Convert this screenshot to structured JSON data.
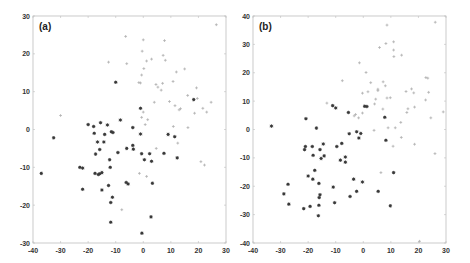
{
  "chart_data": [
    {
      "type": "scatter",
      "title": "(a)",
      "panel_label": "(a)",
      "xlabel": "",
      "ylabel": "",
      "xlim": [
        -40,
        30
      ],
      "ylim": [
        -30,
        30
      ],
      "xticks": [
        -40,
        -30,
        -20,
        -10,
        0,
        10,
        20,
        30
      ],
      "yticks": [
        -30,
        -20,
        -10,
        0,
        10,
        20,
        30
      ],
      "grid": false,
      "legend": null,
      "series": [
        {
          "name": "dark",
          "color": "#3a3a3a",
          "marker": "asterisk",
          "points": [
            [
              -37,
              -11.6
            ],
            [
              -32.5,
              -2.2
            ],
            [
              -10,
              12.5
            ],
            [
              -20,
              1.3
            ],
            [
              -18,
              0.8
            ],
            [
              -17.8,
              -1
            ],
            [
              -15.5,
              1.8
            ],
            [
              -13,
              1.2
            ],
            [
              -14,
              -1.3
            ],
            [
              -11.6,
              -0.6
            ],
            [
              -11,
              -0.8
            ],
            [
              -8.3,
              2.5
            ],
            [
              -16.6,
              -3.3
            ],
            [
              -14.3,
              -3.3
            ],
            [
              -15.8,
              -5.3
            ],
            [
              -17.3,
              -6.5
            ],
            [
              -6,
              -5
            ],
            [
              -9.2,
              -6.1
            ],
            [
              -3.8,
              0.5
            ],
            [
              -3.8,
              -4.2
            ],
            [
              -3.6,
              -5.2
            ],
            [
              -1,
              5.6
            ],
            [
              -1,
              -1.2
            ],
            [
              -0.6,
              -6.4
            ],
            [
              0.4,
              -8
            ],
            [
              2.3,
              -6.4
            ],
            [
              3,
              -8.4
            ],
            [
              7.5,
              -6.3
            ],
            [
              9,
              -1.3
            ],
            [
              11.4,
              -1.9
            ],
            [
              12.3,
              -7.5
            ],
            [
              18.3,
              7.9
            ],
            [
              -23,
              -10
            ],
            [
              -22,
              -10.2
            ],
            [
              -22,
              -15.8
            ],
            [
              -17.5,
              -11.6
            ],
            [
              -16.3,
              -11.9
            ],
            [
              -15.8,
              -11.7
            ],
            [
              -15,
              -11.4
            ],
            [
              -12.2,
              -8
            ],
            [
              -12,
              -10
            ],
            [
              -12.6,
              -14.8
            ],
            [
              -15,
              -16
            ],
            [
              -11.2,
              -17.9
            ],
            [
              -11.8,
              -19.3
            ],
            [
              -11.8,
              -24.5
            ],
            [
              -6.2,
              -14
            ],
            [
              -5.5,
              -14.4
            ],
            [
              3.3,
              -14.2
            ],
            [
              2.8,
              -23.1
            ],
            [
              -0.5,
              -27.4
            ]
          ]
        },
        {
          "name": "light",
          "color": "#b0b0b0",
          "marker": "plus",
          "points": [
            [
              -30,
              3.7
            ],
            [
              -6.4,
              24.6
            ],
            [
              -6,
              17.4
            ],
            [
              -12.6,
              17.8
            ],
            [
              0,
              23.7
            ],
            [
              -0.4,
              20.7
            ],
            [
              0.2,
              16.1
            ],
            [
              7.7,
              23.5
            ],
            [
              7.2,
              19.6
            ],
            [
              8,
              18.3
            ],
            [
              1.2,
              18.1
            ],
            [
              3,
              18.6
            ],
            [
              -0.6,
              14.4
            ],
            [
              -1.6,
              12.4
            ],
            [
              -1,
              12.3
            ],
            [
              12,
              15.2
            ],
            [
              15,
              16
            ],
            [
              4.6,
              11.9
            ],
            [
              5.3,
              11.2
            ],
            [
              6.5,
              10.4
            ],
            [
              7,
              12.2
            ],
            [
              10.8,
              12.7
            ],
            [
              19.3,
              11
            ],
            [
              16.1,
              9
            ],
            [
              19.6,
              8.2
            ],
            [
              4,
              7.2
            ],
            [
              9.5,
              7.4
            ],
            [
              11.5,
              6.3
            ],
            [
              13.5,
              5.5
            ],
            [
              13,
              5.2
            ],
            [
              21.6,
              5.6
            ],
            [
              23,
              4.6
            ],
            [
              24.6,
              7.2
            ],
            [
              18.6,
              4.3
            ],
            [
              0,
              4.6
            ],
            [
              -0.6,
              3.2
            ],
            [
              1.6,
              2.6
            ],
            [
              0.7,
              1.3
            ],
            [
              10.9,
              0.8
            ],
            [
              16.2,
              0.5
            ],
            [
              12.5,
              -3.6
            ],
            [
              4.7,
              -5
            ],
            [
              20.9,
              -8.5
            ],
            [
              22.2,
              -9.4
            ],
            [
              -1.4,
              -11.6
            ],
            [
              1.2,
              -12.4
            ],
            [
              -7.8,
              -21.2
            ],
            [
              26.5,
              27.7
            ]
          ]
        }
      ]
    },
    {
      "type": "scatter",
      "title": "(b)",
      "panel_label": "(b)",
      "xlabel": "",
      "ylabel": "",
      "xlim": [
        -40,
        30
      ],
      "ylim": [
        -40,
        40
      ],
      "xticks": [
        -40,
        -30,
        -20,
        -10,
        0,
        10,
        20,
        30
      ],
      "yticks": [
        -40,
        -30,
        -20,
        -10,
        0,
        10,
        20,
        30,
        40
      ],
      "grid": false,
      "legend": null,
      "series": [
        {
          "name": "dark",
          "color": "#3a3a3a",
          "marker": "asterisk",
          "points": [
            [
              -33.3,
              1.2
            ],
            [
              -20.8,
              3.8
            ],
            [
              -17,
              0.5
            ],
            [
              -11.1,
              8.4
            ],
            [
              -10,
              7.6
            ],
            [
              -5.4,
              6
            ],
            [
              -5.1,
              -1.5
            ],
            [
              -2.4,
              -0.8
            ],
            [
              -0.9,
              -1.4
            ],
            [
              -1.6,
              -3
            ],
            [
              0.5,
              8.2
            ],
            [
              1.3,
              8.1
            ],
            [
              7.8,
              4.3
            ],
            [
              8.2,
              -3.8
            ],
            [
              -21,
              -6
            ],
            [
              -21.3,
              -7.1
            ],
            [
              -18.5,
              -6
            ],
            [
              -15.7,
              -7.1
            ],
            [
              -14.5,
              -5.1
            ],
            [
              -18.2,
              -9.1
            ],
            [
              -15.3,
              -10.2
            ],
            [
              -14.2,
              -9.3
            ],
            [
              -9.6,
              -6
            ],
            [
              -7.8,
              -4.9
            ],
            [
              -8.3,
              -10.8
            ],
            [
              -6.5,
              -9.7
            ],
            [
              -6.5,
              -11.5
            ],
            [
              -17.6,
              -14.4
            ],
            [
              -20,
              -16.4
            ],
            [
              -18.3,
              -17.5
            ],
            [
              -27.3,
              -19.3
            ],
            [
              -16.1,
              -19
            ],
            [
              -10.9,
              -20.3
            ],
            [
              -3.5,
              -17.5
            ],
            [
              -0.3,
              -18.5
            ],
            [
              5.4,
              -21.8
            ],
            [
              11,
              -15.2
            ],
            [
              -28.8,
              -22.7
            ],
            [
              -27,
              -26.3
            ],
            [
              -21.6,
              -27.9
            ],
            [
              -19.3,
              -27.1
            ],
            [
              -16.1,
              -26.7
            ],
            [
              -15.7,
              -23
            ],
            [
              -16,
              -24
            ],
            [
              -10.4,
              -25.8
            ],
            [
              -4.8,
              -23.6
            ],
            [
              -2.4,
              -21.8
            ],
            [
              9.8,
              -26.9
            ],
            [
              -16.3,
              -30.4
            ]
          ]
        },
        {
          "name": "light",
          "color": "#b0b0b0",
          "marker": "plus",
          "points": [
            [
              8.6,
              36.8
            ],
            [
              26.1,
              37.8
            ],
            [
              8.2,
              30.3
            ],
            [
              11,
              30.9
            ],
            [
              11,
              28
            ],
            [
              11.1,
              25.7
            ],
            [
              13.9,
              26.2
            ],
            [
              5.9,
              28.9
            ],
            [
              -1.4,
              23.5
            ],
            [
              1,
              20.1
            ],
            [
              -7.6,
              17.2
            ],
            [
              2.7,
              16.5
            ],
            [
              7.2,
              16.8
            ],
            [
              8,
              15.4
            ],
            [
              5.3,
              14.2
            ],
            [
              5.3,
              13.7
            ],
            [
              -0.3,
              12.8
            ],
            [
              1.7,
              13.3
            ],
            [
              15.5,
              13.4
            ],
            [
              17.5,
              14.3
            ],
            [
              18.3,
              12.9
            ],
            [
              22.7,
              18.3
            ],
            [
              23.4,
              18.1
            ],
            [
              23.7,
              13.1
            ],
            [
              8.6,
              11.1
            ],
            [
              9.8,
              11.2
            ],
            [
              4.5,
              10.7
            ],
            [
              4.1,
              9
            ],
            [
              -13.2,
              9.3
            ],
            [
              -3.3,
              4.8
            ],
            [
              -2.8,
              5.3
            ],
            [
              -1.7,
              4.1
            ],
            [
              -0.3,
              5.8
            ],
            [
              7.1,
              7.2
            ],
            [
              16.2,
              7.3
            ],
            [
              15.8,
              6
            ],
            [
              18.6,
              7.9
            ],
            [
              22.6,
              10.4
            ],
            [
              29,
              6.2
            ],
            [
              24.5,
              4.1
            ],
            [
              13.6,
              2.5
            ],
            [
              9,
              0.6
            ],
            [
              11.6,
              0.6
            ],
            [
              3.9,
              -0.3
            ],
            [
              13.8,
              -2.8
            ],
            [
              10.8,
              -5.9
            ],
            [
              18.6,
              -5.2
            ],
            [
              26,
              -8.5
            ],
            [
              6.4,
              -15.2
            ],
            [
              20.4,
              -39.4
            ]
          ]
        }
      ]
    }
  ],
  "layout": {
    "panels": [
      {
        "left": 33,
        "top": 16,
        "right": 226,
        "bottom": 243
      },
      {
        "left": 253,
        "top": 16,
        "right": 446,
        "bottom": 243
      }
    ]
  }
}
